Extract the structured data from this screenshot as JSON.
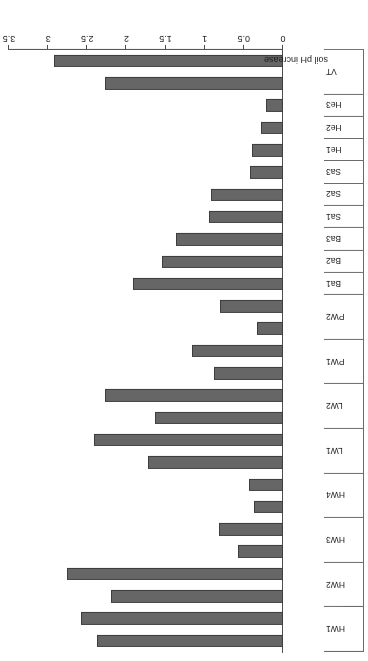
{
  "chart_data": {
    "type": "bar",
    "orientation": "horizontal",
    "title": "",
    "xlabel": "soil pH increase",
    "ylabel": "",
    "xlim": [
      0,
      3.5
    ],
    "xticks": [
      "0",
      "0.5",
      "1",
      "1.5",
      "2",
      "2.5",
      "3",
      "3.5"
    ],
    "grid": false,
    "legend": false,
    "categories": [
      "HW1",
      "HW2",
      "HW3",
      "HW4",
      "LW1",
      "LW2",
      "PW1",
      "PW2",
      "Ba1",
      "Ba2",
      "Ba3",
      "Sa1",
      "Sa2",
      "Sa3",
      "He1",
      "He2",
      "He3",
      "VT"
    ],
    "rate_labels": [
      "2%",
      "5%"
    ],
    "series": [
      {
        "name": "2%",
        "values": [
          2.38,
          2.2,
          0.57,
          0.37,
          1.73,
          1.63,
          0.88,
          0.33,
          1.92,
          1.55,
          1.37,
          0.95,
          0.92,
          0.42,
          0.4,
          0.28,
          0.22,
          2.28
        ]
      },
      {
        "name": "5%",
        "values": [
          2.58,
          2.76,
          0.82,
          0.43,
          2.42,
          2.28,
          1.16,
          0.8,
          null,
          null,
          null,
          null,
          null,
          null,
          null,
          null,
          null,
          2.92
        ]
      }
    ],
    "bars": [
      {
        "category": "HW1",
        "rate": "2%",
        "value": 2.38
      },
      {
        "category": "HW1",
        "rate": "5%",
        "value": 2.58
      },
      {
        "category": "HW2",
        "rate": "2%",
        "value": 2.2
      },
      {
        "category": "HW2",
        "rate": "5%",
        "value": 2.76
      },
      {
        "category": "HW3",
        "rate": "2%",
        "value": 0.57
      },
      {
        "category": "HW3",
        "rate": "5%",
        "value": 0.82
      },
      {
        "category": "HW4",
        "rate": "2%",
        "value": 0.37
      },
      {
        "category": "HW4",
        "rate": "5%",
        "value": 0.43
      },
      {
        "category": "LW1",
        "rate": "2%",
        "value": 1.73
      },
      {
        "category": "LW1",
        "rate": "5%",
        "value": 2.42
      },
      {
        "category": "LW2",
        "rate": "2%",
        "value": 1.63
      },
      {
        "category": "LW2",
        "rate": "5%",
        "value": 2.28
      },
      {
        "category": "PW1",
        "rate": "2%",
        "value": 0.88
      },
      {
        "category": "PW1",
        "rate": "5%",
        "value": 1.16
      },
      {
        "category": "PW2",
        "rate": "2%",
        "value": 0.33
      },
      {
        "category": "PW2",
        "rate": "5%",
        "value": 0.8
      },
      {
        "category": "Ba1",
        "rate": "2%",
        "value": 1.92
      },
      {
        "category": "Ba2",
        "rate": "2%",
        "value": 1.55
      },
      {
        "category": "Ba3",
        "rate": "2%",
        "value": 1.37
      },
      {
        "category": "Sa1",
        "rate": "2%",
        "value": 0.95
      },
      {
        "category": "Sa2",
        "rate": "2%",
        "value": 0.92
      },
      {
        "category": "Sa3",
        "rate": "2%",
        "value": 0.42
      },
      {
        "category": "He1",
        "rate": "2%",
        "value": 0.4
      },
      {
        "category": "He2",
        "rate": "2%",
        "value": 0.28
      },
      {
        "category": "He3",
        "rate": "2%",
        "value": 0.22
      },
      {
        "category": "VT",
        "rate": "2%",
        "value": 2.28
      },
      {
        "category": "VT",
        "rate": "5%",
        "value": 2.92
      }
    ],
    "colors": {
      "bar_fill": "#666666",
      "bar_edge": "#3d3d3d",
      "axis": "#4d4d4d",
      "text": "#1a1a1a",
      "background": "#ffffff"
    }
  }
}
